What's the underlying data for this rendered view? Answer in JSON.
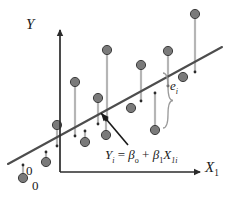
{
  "figure": {
    "title": "",
    "colors": {
      "point_fill": "#7a7a7a",
      "point_stroke": "#3d3d3d",
      "regression_line": "#4d4d4d",
      "stem_line": "#b5b5b5",
      "axis": "#2b2b2b",
      "text": "#1a1a1a",
      "brace": "#9a9a9a",
      "background": "#ffffff"
    }
  },
  "axes": {
    "y_label": "Y",
    "x_label": "X",
    "x_label_subscript": "1",
    "origin_label_on_line": "0",
    "origin_label_on_axis": "0",
    "y_axis_x": 60,
    "x_axis_y": 172,
    "y_axis_top": 30,
    "x_axis_right": 200
  },
  "annotations": {
    "residual_brace_label": "e",
    "residual_brace_subscript": "i",
    "equation": {
      "lhs": "Y",
      "lhs_sub": "i",
      "eq": "=",
      "b0": "β",
      "b0_sub": "o",
      "plus": "+",
      "b1": "β",
      "b1_sub": "1",
      "x": "X",
      "x_sub": "1i"
    },
    "arrow": {
      "from_x": 128,
      "from_y": 145,
      "to_x": 101,
      "to_y": 113
    },
    "brace": {
      "x": 163,
      "top_y": 73,
      "bottom_y": 128
    }
  },
  "chart_data": {
    "type": "scatter",
    "title": "",
    "xlabel": "X1",
    "ylabel": "Y",
    "grid": false,
    "legend": false,
    "regression_line": {
      "label": "Y_i = β_o + β_1 X_1i",
      "x_start": 8,
      "y_start": 164,
      "x_end": 222,
      "y_end": 47
    },
    "points_px": [
      {
        "x": 23,
        "y": 178,
        "line_y": 165
      },
      {
        "x": 46,
        "y": 162,
        "line_y": 152
      },
      {
        "x": 57,
        "y": 125,
        "line_y": 146
      },
      {
        "x": 75,
        "y": 82,
        "line_y": 136
      },
      {
        "x": 85,
        "y": 142,
        "line_y": 131
      },
      {
        "x": 98,
        "y": 98,
        "line_y": 124
      },
      {
        "x": 106,
        "y": 135,
        "line_y": 120
      },
      {
        "x": 107,
        "y": 50,
        "line_y": 119
      },
      {
        "x": 131,
        "y": 108,
        "line_y": 106
      },
      {
        "x": 141,
        "y": 65,
        "line_y": 101
      },
      {
        "x": 155,
        "y": 130,
        "line_y": 93
      },
      {
        "x": 168,
        "y": 51,
        "line_y": 86
      },
      {
        "x": 183,
        "y": 77,
        "line_y": 78
      },
      {
        "x": 195,
        "y": 14,
        "line_y": 72
      }
    ]
  }
}
